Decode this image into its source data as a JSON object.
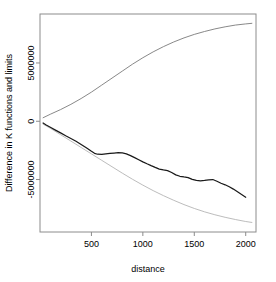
{
  "chart_data": {
    "type": "line",
    "title": "",
    "subtitle": "",
    "xlabel": "distance",
    "ylabel": "Difference in K functions and limits",
    "xlim": [
      0,
      2100
    ],
    "ylim": [
      -9500000,
      9200000
    ],
    "xticks": [
      500,
      1000,
      1500,
      2000
    ],
    "xticklabels": [
      "500",
      "1000",
      "1500",
      "2000"
    ],
    "yticks": [
      5000000,
      0,
      -5000000
    ],
    "yticklabels": [
      "5000000",
      "0",
      "-5000000"
    ],
    "grid": false,
    "legend": null,
    "box": true,
    "series": [
      {
        "name": "upper-envelope",
        "style": "solid-gray",
        "color": "#7a7a7a",
        "x": [
          30,
          100,
          200,
          300,
          400,
          500,
          600,
          700,
          800,
          900,
          1000,
          1100,
          1200,
          1300,
          1400,
          1500,
          1600,
          1700,
          1800,
          1900,
          2000,
          2060
        ],
        "y": [
          300000,
          600000,
          1000000,
          1450000,
          1950000,
          2500000,
          3100000,
          3700000,
          4300000,
          4900000,
          5450000,
          5950000,
          6400000,
          6800000,
          7150000,
          7450000,
          7700000,
          7920000,
          8100000,
          8250000,
          8350000,
          8400000
        ]
      },
      {
        "name": "lower-envelope",
        "style": "solid-lightgray",
        "color": "#b4b4b4",
        "x": [
          30,
          100,
          200,
          300,
          400,
          500,
          600,
          700,
          800,
          900,
          1000,
          1100,
          1200,
          1300,
          1400,
          1500,
          1600,
          1700,
          1800,
          1900,
          2000,
          2060
        ],
        "y": [
          -250000,
          -600000,
          -1150000,
          -1700000,
          -2250000,
          -2800000,
          -3350000,
          -3900000,
          -4450000,
          -4980000,
          -5480000,
          -5950000,
          -6380000,
          -6780000,
          -7150000,
          -7480000,
          -7770000,
          -8020000,
          -8240000,
          -8430000,
          -8600000,
          -8680000
        ]
      },
      {
        "name": "empirical-difference",
        "style": "solid-black",
        "color": "#1a1a1a",
        "x": [
          30,
          60,
          100,
          150,
          200,
          250,
          300,
          350,
          400,
          450,
          500,
          530,
          560,
          600,
          640,
          680,
          720,
          760,
          800,
          840,
          880,
          920,
          960,
          1000,
          1040,
          1080,
          1120,
          1160,
          1200,
          1240,
          1280,
          1320,
          1360,
          1400,
          1440,
          1480,
          1520,
          1560,
          1600,
          1640,
          1680,
          1720,
          1760,
          1800,
          1840,
          1880,
          1920,
          1960,
          2000
        ],
        "y": [
          -150000,
          -320000,
          -520000,
          -760000,
          -1000000,
          -1250000,
          -1480000,
          -1720000,
          -2000000,
          -2280000,
          -2580000,
          -2750000,
          -2830000,
          -2850000,
          -2800000,
          -2760000,
          -2730000,
          -2700000,
          -2720000,
          -2800000,
          -2950000,
          -3120000,
          -3300000,
          -3480000,
          -3650000,
          -3810000,
          -3960000,
          -4100000,
          -4180000,
          -4240000,
          -4400000,
          -4600000,
          -4720000,
          -4780000,
          -4830000,
          -4980000,
          -5080000,
          -5120000,
          -5080000,
          -5020000,
          -5000000,
          -5150000,
          -5320000,
          -5450000,
          -5620000,
          -5820000,
          -6050000,
          -6280000,
          -6520000
        ]
      }
    ]
  },
  "labels": {
    "xaxis_title": "distance",
    "yaxis_title": "Difference in K functions and limits"
  }
}
